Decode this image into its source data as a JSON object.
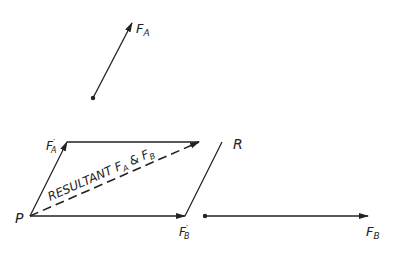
{
  "diagram": {
    "colors": {
      "ink": "#222222",
      "background": "#ffffff"
    },
    "labels": {
      "fa": "F",
      "fa_sub": "A",
      "fb": "F",
      "fb_sub": "B",
      "fa_prime": "F",
      "fa_prime_sub": "A",
      "fa_prime_mark": "′",
      "fb_prime": "F",
      "fb_prime_sub": "B",
      "fb_prime_mark": "′",
      "point_p": "P",
      "point_r": "R",
      "resultant_prefix": "RESULTANT F",
      "resultant_sub_a": "A",
      "resultant_amp": " & F",
      "resultant_sub_b": "B"
    },
    "points": {
      "P": [
        30,
        216
      ],
      "FA_prime_tip": [
        67,
        142
      ],
      "R": [
        199,
        142
      ],
      "FB_prime_tip": [
        185,
        216
      ],
      "FA_start": [
        93,
        98
      ],
      "FA_end": [
        133,
        22
      ],
      "FB_start": [
        205,
        216
      ],
      "FB_end": [
        368,
        216
      ]
    }
  }
}
